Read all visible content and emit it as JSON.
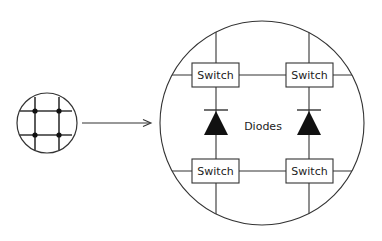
{
  "diagram": {
    "type": "crossbar-zoom-illustration",
    "colors": {
      "stroke": "#333333",
      "fill": "#111111",
      "background": "#ffffff"
    },
    "small_grid": {
      "description": "2x2 crossbar grid with junction dots",
      "junctions": 4
    },
    "arrow": {
      "direction": "right"
    },
    "magnified": {
      "switches": [
        {
          "id": "top-left",
          "label": "Switch"
        },
        {
          "id": "top-right",
          "label": "Switch"
        },
        {
          "id": "bottom-left",
          "label": "Switch"
        },
        {
          "id": "bottom-right",
          "label": "Switch"
        }
      ],
      "diodes_label": "Diodes",
      "diode_count": 2
    }
  }
}
